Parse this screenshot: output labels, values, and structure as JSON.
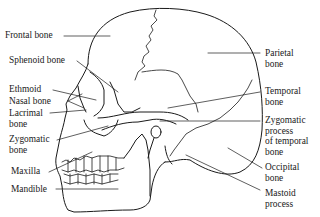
{
  "diagram": {
    "labels_left": [
      {
        "id": "frontal",
        "lines": [
          "Frontal bone"
        ]
      },
      {
        "id": "sphenoid",
        "lines": [
          "Sphenoid bone"
        ]
      },
      {
        "id": "ethmoid",
        "lines": [
          "Ethmoid"
        ]
      },
      {
        "id": "nasal",
        "lines": [
          "Nasal bone"
        ]
      },
      {
        "id": "lacrimal",
        "lines": [
          "Lacrimal",
          "bone"
        ]
      },
      {
        "id": "zygomatic",
        "lines": [
          "Zygomatic",
          "bone"
        ]
      },
      {
        "id": "maxilla",
        "lines": [
          "Maxilla"
        ]
      },
      {
        "id": "mandible",
        "lines": [
          "Mandible"
        ]
      }
    ],
    "labels_right": [
      {
        "id": "parietal",
        "lines": [
          "Parietal",
          "bone"
        ]
      },
      {
        "id": "temporal",
        "lines": [
          "Temporal",
          "bone"
        ]
      },
      {
        "id": "zygomatic_process",
        "lines": [
          "Zygomatic",
          "process",
          "of temporal",
          "bone"
        ]
      },
      {
        "id": "occipital",
        "lines": [
          "Occipital",
          "bone"
        ]
      },
      {
        "id": "mastoid",
        "lines": [
          "Mastoid",
          "process"
        ]
      }
    ],
    "line_color": "#1a1a1a"
  }
}
